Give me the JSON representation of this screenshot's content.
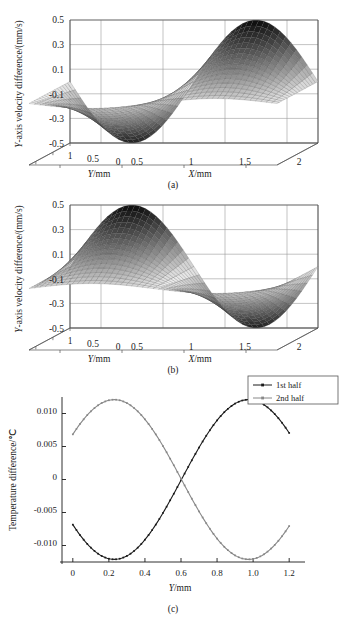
{
  "figure": {
    "panels": [
      {
        "id": "a",
        "caption": "(a)",
        "type": "surface3d",
        "ylabel": "Y-axis velocity difference/(mm/s)",
        "xlabel_x": "X/mm",
        "xlabel_y": "Y/mm",
        "z_ticks": [
          "0.5",
          "0.3",
          "0.1",
          "-0.1",
          "-0.3",
          "-0.5"
        ],
        "z_values": [
          0.5,
          0.3,
          0.1,
          -0.1,
          -0.3,
          -0.5
        ],
        "x_ticks": [
          "0.5",
          "1",
          "1.5",
          "2"
        ],
        "x_values": [
          0.5,
          1,
          1.5,
          2
        ],
        "y_ticks": [
          "1",
          "0.5",
          "0"
        ],
        "y_values": [
          1,
          0.5,
          0
        ]
      },
      {
        "id": "b",
        "caption": "(b)",
        "type": "surface3d",
        "ylabel": "Y-axis velocity difference/(mm/s)",
        "xlabel_x": "X/mm",
        "xlabel_y": "Y/mm",
        "z_ticks": [
          "0.5",
          "0.3",
          "0.1",
          "-0.1",
          "-0.3",
          "-0.5"
        ],
        "z_values": [
          0.5,
          0.3,
          0.1,
          -0.1,
          -0.3,
          -0.5
        ],
        "x_ticks": [
          "0.5",
          "1",
          "1.5",
          "2"
        ],
        "x_values": [
          0.5,
          1,
          1.5,
          2
        ],
        "y_ticks": [
          "1",
          "0.5",
          "0"
        ],
        "y_values": [
          1,
          0.5,
          0
        ]
      },
      {
        "id": "c",
        "caption": "(c)",
        "type": "line",
        "ylabel": "Temperature difference/℃",
        "xlabel": "Y/mm",
        "legend": [
          "1st half",
          "2nd half"
        ]
      }
    ]
  },
  "chart_data": [
    {
      "type": "surface",
      "panel": "a",
      "title": "(a)",
      "xlabel": "X/mm",
      "ylabel": "Y/mm",
      "zlabel": "Y-axis velocity difference/(mm/s)",
      "xlim": [
        0.25,
        2.25
      ],
      "ylim": [
        0,
        1.2
      ],
      "zlim": [
        -0.5,
        0.5
      ],
      "xticks": [
        0.5,
        1,
        1.5,
        2
      ],
      "yticks": [
        1,
        0.5,
        0
      ],
      "zticks": [
        0.5,
        0.3,
        0.1,
        -0.1,
        -0.3,
        -0.5
      ],
      "grid": true,
      "description": "Saddle-like sinusoidal sheet: deep trough near X=0.6, rising to a tall crest near X=1.7; amplitude tapers toward Y=1.2 edge",
      "surface_formula": "z = A(y) * sin(2*pi*(x-0.1)/2.2 + pi) with A ranging 0.02..0.50 across y",
      "z_min": -0.5,
      "z_max": 0.47,
      "trough_at_x": 0.6,
      "crest_at_x": 1.7
    },
    {
      "type": "surface",
      "panel": "b",
      "title": "(b)",
      "xlabel": "X/mm",
      "ylabel": "Y/mm",
      "zlabel": "Y-axis velocity difference/(mm/s)",
      "xlim": [
        0.25,
        2.25
      ],
      "ylim": [
        0,
        1.2
      ],
      "zlim": [
        -0.5,
        0.5
      ],
      "xticks": [
        0.5,
        1,
        1.5,
        2
      ],
      "yticks": [
        1,
        0.5,
        0
      ],
      "zticks": [
        0.5,
        0.3,
        0.1,
        -0.1,
        -0.3,
        -0.5
      ],
      "grid": true,
      "description": "Mirror of panel (a): tall crest near X=0.6 and deep trough near X=1.7",
      "surface_formula": "z = A(y) * sin(2*pi*(x-0.1)/2.2) with A ranging 0.02..0.50 across y",
      "z_min": -0.5,
      "z_max": 0.47,
      "crest_at_x": 0.6,
      "trough_at_x": 1.7
    },
    {
      "type": "line",
      "panel": "c",
      "title": "(c)",
      "xlabel": "Y/mm",
      "ylabel": "Temperature difference/℃",
      "xlim": [
        -0.06,
        1.26
      ],
      "ylim": [
        -0.0125,
        0.0125
      ],
      "xticks": [
        0,
        0.2,
        0.4,
        0.6,
        0.8,
        1.0,
        1.2
      ],
      "xticklabels": [
        "0",
        "0.2",
        "0.4",
        "0.6",
        "0.8",
        "1.0",
        "1.2"
      ],
      "yticks": [
        0.01,
        0.005,
        0,
        -0.005,
        -0.01
      ],
      "yticklabels": [
        "0.010",
        "0.005",
        "0",
        "-0.005",
        "-0.010"
      ],
      "grid": false,
      "legend_position": "top-right-outside",
      "series": [
        {
          "name": "1st half",
          "color": "#1a1a1a",
          "marker": "square-small",
          "x": [
            0.0,
            0.03,
            0.06,
            0.09,
            0.12,
            0.15,
            0.18,
            0.21,
            0.24,
            0.27,
            0.3,
            0.33,
            0.36,
            0.39,
            0.42,
            0.45,
            0.48,
            0.51,
            0.54,
            0.57,
            0.6,
            0.63,
            0.66,
            0.69,
            0.72,
            0.75,
            0.78,
            0.81,
            0.84,
            0.87,
            0.9,
            0.93,
            0.96,
            0.99,
            1.02,
            1.05,
            1.08,
            1.11,
            1.14,
            1.17,
            1.2
          ],
          "y": [
            -0.0018,
            -0.0043,
            -0.0065,
            -0.0085,
            -0.0101,
            -0.0112,
            -0.0118,
            -0.012,
            -0.0119,
            -0.0113,
            -0.0104,
            -0.0092,
            -0.0077,
            -0.006,
            -0.0042,
            -0.0023,
            -0.0003,
            0.0017,
            0.0037,
            0.0056,
            0.0,
            0.009,
            0.0101,
            0.0108,
            0.0112,
            0.0112,
            0.011,
            0.0109,
            0.011,
            0.011,
            0.011,
            0.0109,
            0.0108,
            0.0107,
            0.01,
            0.0088,
            0.0072,
            0.0054,
            0.0035,
            0.0018,
            0.0006
          ]
        },
        {
          "name": "2nd half",
          "color": "#888888",
          "marker": "square-small",
          "x": [
            0.0,
            0.03,
            0.06,
            0.09,
            0.12,
            0.15,
            0.18,
            0.21,
            0.24,
            0.27,
            0.3,
            0.33,
            0.36,
            0.39,
            0.42,
            0.45,
            0.48,
            0.51,
            0.54,
            0.57,
            0.6,
            0.63,
            0.66,
            0.69,
            0.72,
            0.75,
            0.78,
            0.81,
            0.84,
            0.87,
            0.9,
            0.93,
            0.96,
            0.99,
            1.02,
            1.05,
            1.08,
            1.11,
            1.14,
            1.17,
            1.2
          ],
          "y": [
            0.0006,
            0.0032,
            0.0056,
            0.0077,
            0.0094,
            0.0105,
            0.011,
            0.0111,
            0.011,
            0.0108,
            0.0104,
            0.0098,
            0.009,
            0.008,
            0.0068,
            0.0055,
            0.0041,
            0.0027,
            0.0013,
            0.0004,
            0.0,
            -0.0031,
            -0.005,
            -0.0068,
            -0.0085,
            -0.0098,
            -0.0109,
            -0.0116,
            -0.012,
            -0.0121,
            -0.012,
            -0.0118,
            -0.0114,
            -0.0106,
            -0.0096,
            -0.0083,
            -0.0068,
            -0.0052,
            -0.0036,
            -0.0026,
            -0.0018
          ]
        }
      ]
    }
  ]
}
